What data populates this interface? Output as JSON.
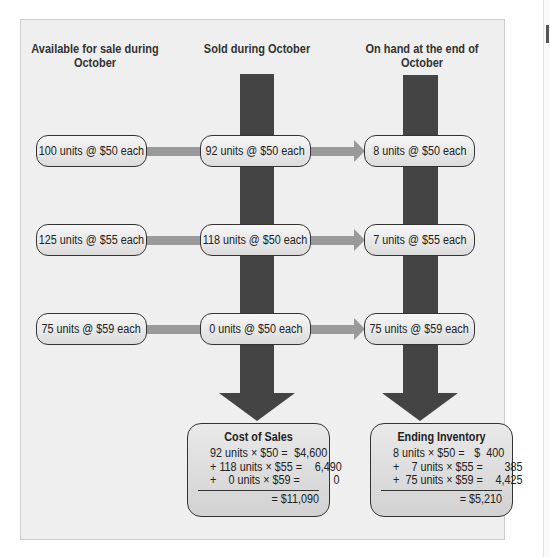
{
  "columns": {
    "available": "Available for sale during October",
    "sold": "Sold during October",
    "on_hand": "On hand at the end of October"
  },
  "rows": [
    {
      "available": "100 units @ $50 each",
      "sold": "92 units @ $50 each",
      "on_hand": "8 units @ $50 each"
    },
    {
      "available": "125 units @ $55 each",
      "sold": "118 units @ $50 each",
      "on_hand": "7 units @ $55 each"
    },
    {
      "available": "75 units @ $59 each",
      "sold": "0 units @ $50 each",
      "on_hand": "75 units @ $59 each"
    }
  ],
  "cost_of_sales": {
    "title": "Cost of Sales",
    "lines": [
      {
        "lhs": "92 units × $50 =",
        "rhs": "$4,600"
      },
      {
        "lhs": "+ 118 units × $55 =",
        "rhs": "6,490"
      },
      {
        "lhs": "+    0 units × $59 =",
        "rhs": "0"
      }
    ],
    "total": "= $11,090"
  },
  "ending_inventory": {
    "title": "Ending Inventory",
    "lines": [
      {
        "lhs": "8 units × $50 =",
        "rhs": "$  400"
      },
      {
        "lhs": "+    7 units × $55 =",
        "rhs": "385"
      },
      {
        "lhs": "+  75 units × $59 =",
        "rhs": "4,425"
      }
    ],
    "total": "= $5,210"
  },
  "colors": {
    "panel_bg": "#efefef",
    "dark_arrow": "#444444",
    "light_arrow": "#9a9a9a",
    "box_border": "#333333"
  }
}
